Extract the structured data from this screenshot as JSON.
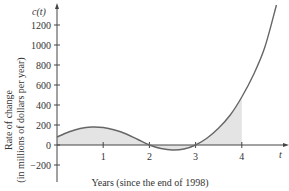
{
  "chart_data": {
    "type": "area",
    "title": "",
    "xlabel": "Years (since the end of 1998)",
    "ylabel_line1": "Rate of change",
    "ylabel_line2": "(in millions of dollars per year)",
    "x_axis_name": "t",
    "y_axis_name": "c(t)",
    "x_ticks": [
      "1",
      "2",
      "3",
      "4"
    ],
    "y_ticks": [
      "1200",
      "1000",
      "800",
      "600",
      "400",
      "200",
      "0",
      "−200"
    ],
    "xlim": [
      0,
      4.9
    ],
    "ylim": [
      -300,
      1450
    ],
    "shaded_region": {
      "from": 0,
      "to": 4
    },
    "series": [
      {
        "name": "c(t)",
        "x": [
          0,
          0.25,
          0.5,
          0.75,
          1,
          1.25,
          1.5,
          1.75,
          2,
          2.25,
          2.5,
          2.75,
          3,
          3.25,
          3.5,
          3.75,
          4,
          4.25,
          4.5,
          4.75
        ],
        "values": [
          80,
          130,
          165,
          180,
          175,
          150,
          110,
          55,
          0,
          -35,
          -50,
          -40,
          0,
          70,
          170,
          300,
          480,
          700,
          980,
          1400
        ]
      }
    ],
    "colors": {
      "curve": "#666666",
      "fill": "#e6e6e6",
      "axis": "#444444"
    }
  }
}
